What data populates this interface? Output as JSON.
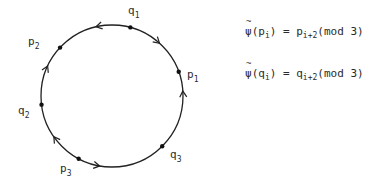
{
  "diagram": {
    "points": [
      {
        "id": "q1",
        "letter": "q",
        "index": "1"
      },
      {
        "id": "p1",
        "letter": "p",
        "index": "1"
      },
      {
        "id": "q3",
        "letter": "q",
        "index": "3"
      },
      {
        "id": "p3",
        "letter": "p",
        "index": "3"
      },
      {
        "id": "q2",
        "letter": "q",
        "index": "2"
      },
      {
        "id": "p2",
        "letter": "p",
        "index": "2"
      }
    ],
    "formulas": [
      {
        "func": "ψ",
        "arg_letter": "p",
        "arg_index": "i",
        "rhs_letter": "p",
        "rhs_index": "i+2",
        "mod": "(mod 3)"
      },
      {
        "func": "ψ",
        "arg_letter": "q",
        "arg_index": "i",
        "rhs_letter": "q",
        "rhs_index": "i+2",
        "mod": "(mod 3)"
      }
    ]
  }
}
